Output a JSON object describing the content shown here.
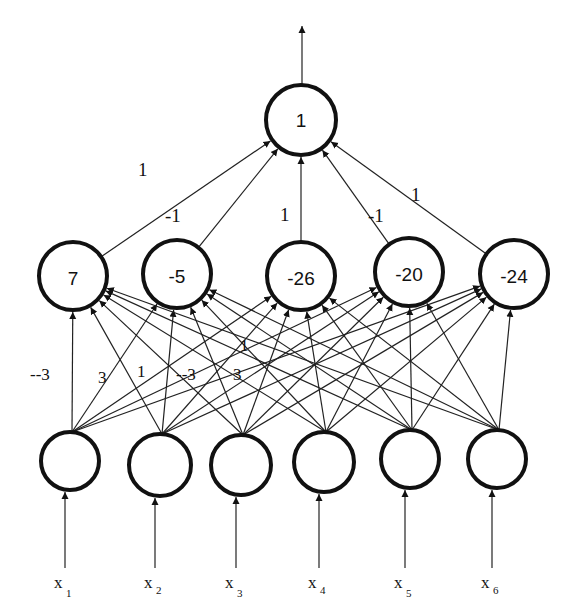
{
  "diagram": {
    "type": "neural-network",
    "output_node": {
      "label": "1",
      "x": 301,
      "y": 120,
      "r": 35
    },
    "hidden_nodes": [
      {
        "label": "7",
        "x": 73,
        "y": 276,
        "r": 34
      },
      {
        "label": "-5",
        "x": 177,
        "y": 274,
        "r": 34
      },
      {
        "label": "-26",
        "x": 301,
        "y": 276,
        "r": 34
      },
      {
        "label": "-20",
        "x": 409,
        "y": 272,
        "r": 34
      },
      {
        "label": "-24",
        "x": 514,
        "y": 274,
        "r": 34
      }
    ],
    "input_nodes": [
      {
        "label": "x",
        "sub": "1",
        "x": 70,
        "y": 461,
        "r": 29
      },
      {
        "label": "x",
        "sub": "2",
        "x": 160,
        "y": 465,
        "r": 31
      },
      {
        "label": "x",
        "sub": "3",
        "x": 241,
        "y": 465,
        "r": 30
      },
      {
        "label": "x",
        "sub": "4",
        "x": 324,
        "y": 462,
        "r": 30
      },
      {
        "label": "x",
        "sub": "5",
        "x": 410,
        "y": 459,
        "r": 29
      },
      {
        "label": "x",
        "sub": "6",
        "x": 497,
        "y": 459,
        "r": 29
      }
    ],
    "output_weights": [
      "1",
      "-1",
      "1",
      "-1",
      "1"
    ],
    "input_weight_labels": [
      {
        "text": "--3",
        "x": 30,
        "y": 380
      },
      {
        "text": "3",
        "x": 98,
        "y": 383
      },
      {
        "text": "1",
        "x": 137,
        "y": 377
      },
      {
        "text": "--3",
        "x": 176,
        "y": 380
      },
      {
        "text": "3",
        "x": 233,
        "y": 380
      },
      {
        "text": "1",
        "x": 240,
        "y": 351
      }
    ]
  }
}
